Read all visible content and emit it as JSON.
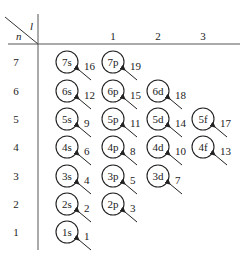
{
  "header": {
    "l_label": "l",
    "n_label": "n",
    "columns": [
      {
        "l": "",
        "x": 67
      },
      {
        "l": "1",
        "x": 113
      },
      {
        "l": "2",
        "x": 158
      },
      {
        "l": "3",
        "x": 203
      }
    ]
  },
  "rows": [
    {
      "n": "7",
      "y": 62
    },
    {
      "n": "6",
      "y": 91
    },
    {
      "n": "5",
      "y": 119
    },
    {
      "n": "4",
      "y": 147
    },
    {
      "n": "3",
      "y": 176
    },
    {
      "n": "2",
      "y": 204
    },
    {
      "n": "1",
      "y": 232
    }
  ],
  "orbitals": [
    {
      "label": "7s",
      "row": 0,
      "col": 0,
      "order": "16"
    },
    {
      "label": "7p",
      "row": 0,
      "col": 1,
      "order": "19"
    },
    {
      "label": "6s",
      "row": 1,
      "col": 0,
      "order": "12"
    },
    {
      "label": "6p",
      "row": 1,
      "col": 1,
      "order": "15"
    },
    {
      "label": "6d",
      "row": 1,
      "col": 2,
      "order": "18"
    },
    {
      "label": "5s",
      "row": 2,
      "col": 0,
      "order": "9"
    },
    {
      "label": "5p",
      "row": 2,
      "col": 1,
      "order": "11"
    },
    {
      "label": "5d",
      "row": 2,
      "col": 2,
      "order": "14"
    },
    {
      "label": "5f",
      "row": 2,
      "col": 3,
      "order": "17"
    },
    {
      "label": "4s",
      "row": 3,
      "col": 0,
      "order": "6"
    },
    {
      "label": "4p",
      "row": 3,
      "col": 1,
      "order": "8"
    },
    {
      "label": "4d",
      "row": 3,
      "col": 2,
      "order": "10"
    },
    {
      "label": "4f",
      "row": 3,
      "col": 3,
      "order": "13"
    },
    {
      "label": "3s",
      "row": 4,
      "col": 0,
      "order": "4"
    },
    {
      "label": "3p",
      "row": 4,
      "col": 1,
      "order": "5"
    },
    {
      "label": "3d",
      "row": 4,
      "col": 2,
      "order": "7"
    },
    {
      "label": "2s",
      "row": 5,
      "col": 0,
      "order": "2"
    },
    {
      "label": "2p",
      "row": 5,
      "col": 1,
      "order": "3"
    },
    {
      "label": "1s",
      "row": 6,
      "col": 0,
      "order": "1"
    }
  ],
  "colors": {
    "ink": "#222222",
    "background": "#ffffff"
  }
}
